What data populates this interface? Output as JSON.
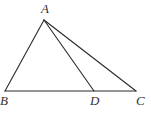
{
  "diagram": {
    "type": "geometry-triangle",
    "points": {
      "A": {
        "x": 44,
        "y": 20,
        "label": "A",
        "label_x": 41,
        "label_y": 13
      },
      "B": {
        "x": 5,
        "y": 91,
        "label": "B",
        "label_x": 0,
        "label_y": 105
      },
      "D": {
        "x": 94,
        "y": 91,
        "label": "D",
        "label_x": 91,
        "label_y": 105
      },
      "C": {
        "x": 136,
        "y": 91,
        "label": "C",
        "label_x": 136,
        "label_y": 105
      }
    },
    "segments": [
      "AB",
      "AC",
      "AD",
      "BC"
    ],
    "colors": {
      "stroke": "#2a2a2a",
      "label": "#333333",
      "background": "#ffffff"
    }
  }
}
